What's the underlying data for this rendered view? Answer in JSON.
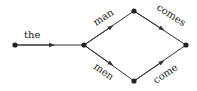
{
  "diagram": {
    "type": "word-lattice",
    "nodes": [
      {
        "id": "n0",
        "x": 15,
        "y": 45
      },
      {
        "id": "n1",
        "x": 84,
        "y": 45
      },
      {
        "id": "n2",
        "x": 134,
        "y": 11
      },
      {
        "id": "n3",
        "x": 134,
        "y": 81
      },
      {
        "id": "n4",
        "x": 186,
        "y": 45
      }
    ],
    "edges": [
      {
        "from": "n0",
        "to": "n1",
        "label": "the"
      },
      {
        "from": "n1",
        "to": "n2",
        "label": "man"
      },
      {
        "from": "n1",
        "to": "n3",
        "label": "men"
      },
      {
        "from": "n2",
        "to": "n4",
        "label": "comes"
      },
      {
        "from": "n3",
        "to": "n4",
        "label": "come"
      }
    ],
    "colors": {
      "line": "#333333",
      "node": "#222222",
      "text": "#222222"
    }
  }
}
